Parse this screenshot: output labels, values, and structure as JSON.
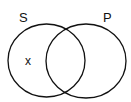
{
  "diagram": {
    "type": "venn",
    "sets": [
      {
        "label": "S",
        "cx": 46.5,
        "cy": 60.5,
        "rx": 38.5,
        "ry": 36.5
      },
      {
        "label": "P",
        "cx": 86,
        "cy": 61,
        "rx": 40,
        "ry": 37
      }
    ],
    "marks": [
      {
        "label": "x",
        "region": "S only"
      }
    ],
    "stroke_color": "#111111",
    "background": "#ffffff"
  }
}
